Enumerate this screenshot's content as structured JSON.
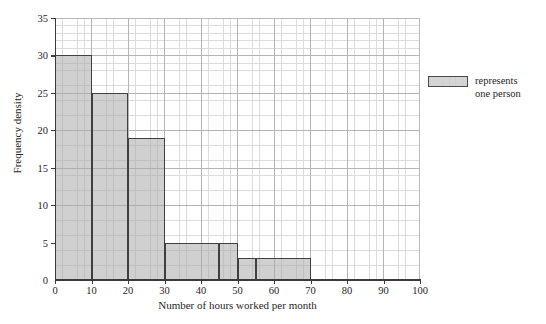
{
  "chart_data": {
    "type": "bar",
    "title": "",
    "subtitle": "",
    "xlabel": "Number of hours worked per month",
    "ylabel": "Frequency density",
    "xlim": [
      0,
      100
    ],
    "ylim": [
      0,
      35
    ],
    "xticks": [
      0,
      10,
      20,
      30,
      40,
      50,
      60,
      70,
      80,
      90,
      100
    ],
    "yticks": [
      0,
      5,
      10,
      15,
      20,
      25,
      30,
      35
    ],
    "grid": true,
    "grid_minor_step_x": 2,
    "grid_minor_step_y": 1,
    "legend_position": "right",
    "bins": [
      {
        "start": 0,
        "end": 10,
        "value": 30
      },
      {
        "start": 10,
        "end": 20,
        "value": 25
      },
      {
        "start": 20,
        "end": 30,
        "value": 19
      },
      {
        "start": 30,
        "end": 45,
        "value": 5
      },
      {
        "start": 45,
        "end": 50,
        "value": 5
      },
      {
        "start": 50,
        "end": 55,
        "value": 3
      },
      {
        "start": 55,
        "end": 70,
        "value": 3
      }
    ],
    "legend": [
      {
        "label_line1": "represents",
        "label_line2": "one person",
        "swatch": "shaded-grid-rectangle"
      }
    ],
    "colors": {
      "bar_fill": "#aaaaaa",
      "bar_edge": "#3f3f3f",
      "axis": "#3a3a3a",
      "grid_minor": "#dcdcdc",
      "grid_major": "#b4b4b4",
      "text": "#262626",
      "background": "#ffffff"
    }
  }
}
